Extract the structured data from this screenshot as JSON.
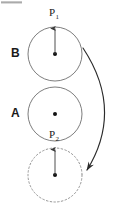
{
  "figure": {
    "width": 117,
    "height": 209,
    "background": "#ffffff",
    "stroke_color": "#6e6e6e",
    "dashed_stroke_color": "#8a8a8a",
    "arrow_color": "#3a3a3a",
    "curved_arrow_color": "#2b2b2b",
    "dot_color": "#111111",
    "label_color": "#1a1a1a"
  },
  "labels": {
    "body_b": "B",
    "body_a": "A",
    "point_1_base": "P",
    "point_1_sub": "1",
    "point_2_base": "P",
    "point_2_sub": "2"
  },
  "shapes": {
    "circle_b": {
      "cx": 55,
      "cy": 54,
      "r": 27,
      "style": "solid"
    },
    "circle_a": {
      "cx": 55,
      "cy": 114,
      "r": 27,
      "style": "solid"
    },
    "circle_ghost": {
      "cx": 55,
      "cy": 175,
      "r": 27,
      "style": "dashed"
    }
  },
  "vectors": {
    "arrow_b": {
      "x1": 55,
      "y1": 54,
      "x2": 55,
      "y2": 27
    },
    "arrow_ghost": {
      "x1": 55,
      "y1": 175,
      "x2": 55,
      "y2": 148
    }
  },
  "curved_arrow": {
    "start_x": 83,
    "start_y": 48,
    "end_x": 86,
    "end_y": 171,
    "control_x": 124,
    "control_y": 110,
    "direction": "down"
  }
}
